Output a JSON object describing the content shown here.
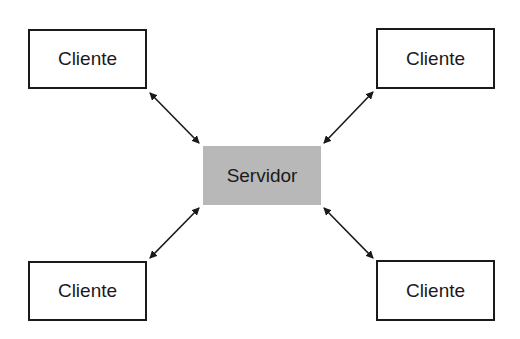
{
  "diagram": {
    "type": "client-server",
    "server": {
      "label": "Servidor",
      "fill": "#b8b8b8"
    },
    "clients": [
      {
        "label": "Cliente",
        "position": "top-left"
      },
      {
        "label": "Cliente",
        "position": "top-right"
      },
      {
        "label": "Cliente",
        "position": "bottom-left"
      },
      {
        "label": "Cliente",
        "position": "bottom-right"
      }
    ],
    "connections": [
      {
        "from": "Cliente (top-left)",
        "to": "Servidor",
        "direction": "bidirectional"
      },
      {
        "from": "Cliente (top-right)",
        "to": "Servidor",
        "direction": "bidirectional"
      },
      {
        "from": "Cliente (bottom-left)",
        "to": "Servidor",
        "direction": "bidirectional"
      },
      {
        "from": "Cliente (bottom-right)",
        "to": "Servidor",
        "direction": "bidirectional"
      }
    ]
  }
}
